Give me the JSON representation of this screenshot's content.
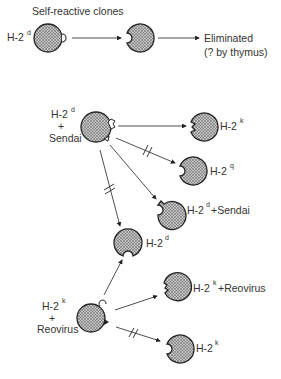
{
  "diagram": {
    "header": {
      "title": "Self-reactive clones",
      "start_label_base": "H-2",
      "start_label_sup": "d",
      "outcome_line1": "Eliminated",
      "outcome_line2": "(? by thymus)"
    },
    "sendai_group": {
      "source_line1_base": "H-2",
      "source_line1_sup": "d",
      "source_line2": "+",
      "source_line3": "Sendai",
      "targets": [
        {
          "base": "H-2",
          "sup": "k",
          "suffix": "",
          "blocked": false
        },
        {
          "base": "H-2",
          "sup": "q",
          "suffix": "",
          "blocked": true
        },
        {
          "base": "H-2",
          "sup": "d",
          "suffix": "+Sendai",
          "blocked": false
        },
        {
          "base": "H-2",
          "sup": "d",
          "suffix": "",
          "blocked": true
        }
      ]
    },
    "reovirus_group": {
      "source_line1_base": "H-2",
      "source_line1_sup": "k",
      "source_line2": "+",
      "source_line3": "Reovirus",
      "targets": [
        {
          "base": "H-2",
          "sup": "d",
          "suffix": "",
          "blocked": false
        },
        {
          "base": "H-2",
          "sup": "k",
          "suffix": "+Reovirus",
          "blocked": false
        },
        {
          "base": "H-2",
          "sup": "k",
          "suffix": "",
          "blocked": true
        }
      ]
    },
    "colors": {
      "cell_fill": "#9a9a9a",
      "stroke": "#222222",
      "text": "#333333"
    }
  }
}
